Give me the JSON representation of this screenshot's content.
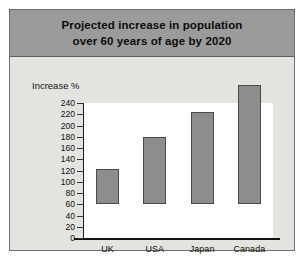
{
  "figure": {
    "title_line_1": "Projected increase in population",
    "title_line_2": "over 60 years of age by 2020",
    "axis_title": "Increase %"
  },
  "chart_data": {
    "type": "bar",
    "title": "Projected increase in population over 60 years of age by 2020",
    "xlabel": "",
    "ylabel": "Increase %",
    "categories": [
      "UK",
      "USA",
      "Japan",
      "Canada"
    ],
    "values": [
      62,
      119,
      163,
      212
    ],
    "ylim": [
      0,
      240
    ],
    "yticks": [
      0,
      20,
      40,
      60,
      80,
      100,
      120,
      140,
      160,
      180,
      200,
      220,
      240
    ],
    "ytick_labels": [
      "0",
      "20",
      "40",
      "60",
      "80",
      "100",
      "120",
      "140",
      "160",
      "180",
      "200",
      "220",
      "240"
    ],
    "grid": false,
    "legend": null,
    "colors": {
      "bar_fill": "#8d8d8d",
      "bar_border": "#4a4a4a",
      "plot_background": "#ffffff",
      "panel_background": "#e3e3e0",
      "title_banner": "#9b9b9b",
      "axis": "#111111",
      "text": "#111111"
    }
  }
}
